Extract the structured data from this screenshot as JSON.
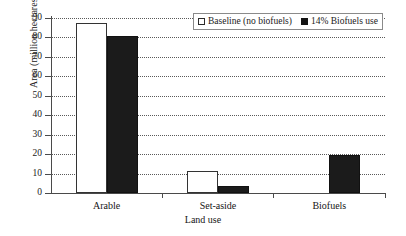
{
  "chart_data": {
    "type": "bar",
    "title": "",
    "xlabel": "Land use",
    "ylabel": "Area (million hectares)",
    "categories": [
      "Arable",
      "Set-aside",
      "Biofuels"
    ],
    "series": [
      {
        "name": "Baseline (no biofuels)",
        "values": [
          87.5,
          11.5,
          0
        ],
        "color": "#ffffff"
      },
      {
        "name": "14% Biofuels use",
        "values": [
          81,
          3.5,
          19.5
        ],
        "color": "#1b1b1b"
      }
    ],
    "ylim": [
      0,
      90
    ],
    "yticks": [
      0,
      10,
      20,
      30,
      40,
      50,
      60,
      70,
      80,
      90
    ],
    "ytick_labels": [
      "0",
      "10",
      "20",
      "30",
      "40",
      "50",
      "60",
      "70",
      "80",
      "90"
    ],
    "grid": "horizontal-dotted",
    "legend_position": "top-right"
  },
  "legend": {
    "entries": [
      {
        "label": "Baseline (no biofuels)",
        "swatch": "open-square-icon"
      },
      {
        "label": "14% Biofuels use",
        "swatch": "filled-square-icon"
      }
    ]
  }
}
